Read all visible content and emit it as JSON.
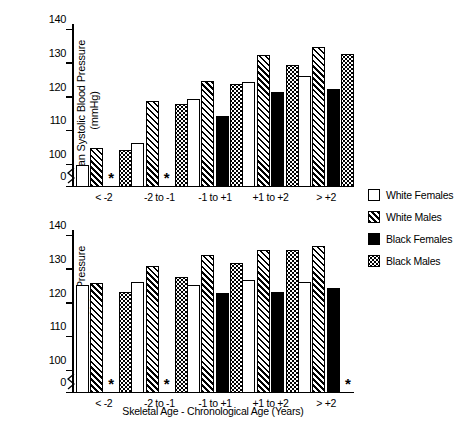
{
  "chart_data": [
    {
      "type": "bar",
      "panel": "top",
      "title": "",
      "xlabel": "",
      "ylabel": "Mean Systolic Blood Pressure (mmHg)",
      "categories": [
        "< -2",
        "-2 to -1",
        "-1 to +1",
        "+1 to +2",
        "> +2"
      ],
      "yticks": [
        "0",
        "100",
        "110",
        "120",
        "130",
        "140"
      ],
      "ylim": [
        100,
        140
      ],
      "axis_break": true,
      "grid": false,
      "series": [
        {
          "name": "White Females",
          "pattern": "open",
          "values": [
            100.0,
            106.5,
            119.5,
            124.5,
            126.5
          ]
        },
        {
          "name": "White Males",
          "pattern": "hatch",
          "values": [
            105.0,
            119.0,
            125.0,
            132.5,
            135.0
          ]
        },
        {
          "name": "Black Females",
          "pattern": "solid",
          "values": [
            null,
            null,
            114.5,
            121.5,
            122.5
          ]
        },
        {
          "name": "Black Males",
          "pattern": "dot",
          "values": [
            104.5,
            118.0,
            124.0,
            129.5,
            133.0
          ]
        }
      ],
      "annotations": [
        {
          "text": "*",
          "category": "< -2",
          "series": "Black Females"
        },
        {
          "text": "*",
          "category": "-2 to -1",
          "series": "Black Females"
        }
      ]
    },
    {
      "type": "bar",
      "panel": "bottom",
      "title": "",
      "xlabel": "Skeletal Age - Chronological Age (Years)",
      "ylabel": "Mean Systolic Blood Pressure (mmHg)",
      "categories": [
        "< -2",
        "-2 to -1",
        "-1 to +1",
        "+1 to +2",
        "> +2"
      ],
      "yticks": [
        "0",
        "100",
        "110",
        "120",
        "130",
        "140"
      ],
      "ylim": [
        100,
        140
      ],
      "axis_break": true,
      "grid": false,
      "series": [
        {
          "name": "White Females",
          "pattern": "open",
          "values": [
            125.5,
            126.5,
            125.5,
            127.0,
            126.5
          ]
        },
        {
          "name": "White Males",
          "pattern": "hatch",
          "values": [
            126.0,
            131.0,
            134.5,
            136.0,
            137.0
          ]
        },
        {
          "name": "Black Females",
          "pattern": "solid",
          "values": [
            null,
            null,
            123.0,
            123.5,
            124.5
          ]
        },
        {
          "name": "Black Males",
          "pattern": "dot",
          "values": [
            123.5,
            128.0,
            132.0,
            136.0,
            null
          ]
        }
      ],
      "annotations": [
        {
          "text": "*",
          "category": "< -2",
          "series": "Black Females"
        },
        {
          "text": "*",
          "category": "-2 to -1",
          "series": "Black Females"
        },
        {
          "text": "*",
          "category": "> +2",
          "series": "Black Males"
        }
      ]
    }
  ],
  "legend": {
    "position": "right",
    "items": [
      {
        "label": "White Females",
        "pattern": "open"
      },
      {
        "label": "White Males",
        "pattern": "hatch"
      },
      {
        "label": "Black Females",
        "pattern": "solid"
      },
      {
        "label": "Black Males",
        "pattern": "dot"
      }
    ]
  },
  "axes": {
    "ylabel_line1": "Mean Systolic Blood Pressure",
    "ylabel_line2": "(mmHg)",
    "ylabel_full": "Mean Systolic Blood Pressure (mmHg)",
    "xlabel": "Skeletal Age - Chronological Age (Years)",
    "yticks": [
      "140",
      "130",
      "120",
      "110",
      "100",
      "0"
    ],
    "categories": [
      "< -2",
      "-2 to -1",
      "-1 to +1",
      "+1 to +2",
      "> +2"
    ]
  },
  "marks": {
    "missing_symbol": "*"
  },
  "colors": {
    "ink": "#000000",
    "background": "#ffffff"
  }
}
